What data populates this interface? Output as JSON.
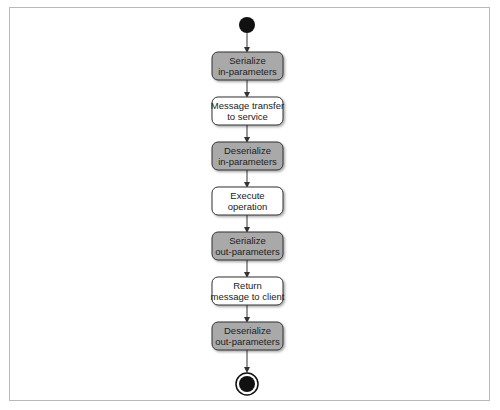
{
  "diagram": {
    "type": "activity-diagram",
    "start": {
      "shape": "filled-circle"
    },
    "end": {
      "shape": "bullseye"
    },
    "colors": {
      "shaded_fill": "#a9a9a9",
      "plain_fill": "#ffffff",
      "stroke": "#333333",
      "frame": "#b8b8b8"
    },
    "nodes": [
      {
        "id": "n1",
        "line1": "Serialize",
        "line2": "in-parameters",
        "style": "shaded"
      },
      {
        "id": "n2",
        "line1": "Message transfer",
        "line2": "to service",
        "style": "plain"
      },
      {
        "id": "n3",
        "line1": "Deserialize",
        "line2": "in-parameters",
        "style": "shaded"
      },
      {
        "id": "n4",
        "line1": "Execute",
        "line2": "operation",
        "style": "plain"
      },
      {
        "id": "n5",
        "line1": "Serialize",
        "line2": "out-parameters",
        "style": "shaded"
      },
      {
        "id": "n6",
        "line1": "Return",
        "line2": "message to client",
        "style": "plain"
      },
      {
        "id": "n7",
        "line1": "Deserialize",
        "line2": "out-parameters",
        "style": "shaded"
      }
    ],
    "edges": [
      [
        "start",
        "n1"
      ],
      [
        "n1",
        "n2"
      ],
      [
        "n2",
        "n3"
      ],
      [
        "n3",
        "n4"
      ],
      [
        "n4",
        "n5"
      ],
      [
        "n5",
        "n6"
      ],
      [
        "n6",
        "n7"
      ],
      [
        "n7",
        "end"
      ]
    ]
  }
}
